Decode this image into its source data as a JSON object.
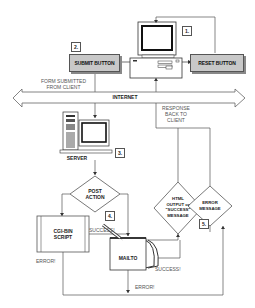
{
  "diagram": {
    "steps": {
      "step1": "1.",
      "step2": "2.",
      "step3": "3.",
      "step4": "4.",
      "step5": "5."
    },
    "buttons": {
      "submit": "SUBMIT BUTTON",
      "reset": "RESET BUTTON"
    },
    "internet": "INTERNET",
    "form_submitted": [
      "FORM SUBMITTED",
      "FROM CLIENT"
    ],
    "response": [
      "RESPONSE",
      "BACK TO",
      "CLIENT"
    ],
    "server": "SERVER",
    "post_action": [
      "POST",
      "ACTION"
    ],
    "cgi_script": [
      "CGI-BIN",
      "SCRIPT"
    ],
    "mailto": "MAILTO",
    "html_output": [
      "HTML",
      "OUTPUT or",
      "\"SUCCESS\"",
      "MESSAGE"
    ],
    "error_message": [
      "ERROR",
      "MESSAGE"
    ],
    "edge_labels": {
      "cgi_success": "SUCCESS!",
      "cgi_error": "ERROR!",
      "mailto_success": "SUCCESS!",
      "mailto_error": "ERROR!"
    }
  }
}
